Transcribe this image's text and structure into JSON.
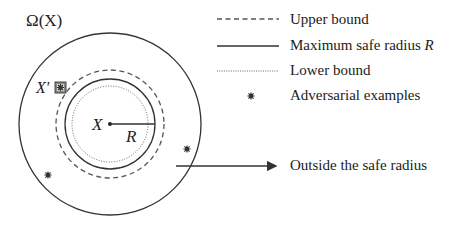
{
  "diagram": {
    "region_label": "Ω(X)",
    "center_label": "X",
    "radius_label": "R",
    "adversarial_point_label": "X′",
    "outside_label": "Outside the safe radius"
  },
  "legend": {
    "items": [
      {
        "style": "dashed",
        "label": "Upper bound"
      },
      {
        "style": "solid",
        "label": "Maximum safe radius ",
        "label_italic": "R"
      },
      {
        "style": "dotted",
        "label": "Lower bound"
      },
      {
        "style": "marker",
        "label": "Adversarial examples"
      }
    ]
  },
  "colors": {
    "stroke": "#333333",
    "text": "#222222",
    "background": "#ffffff"
  }
}
